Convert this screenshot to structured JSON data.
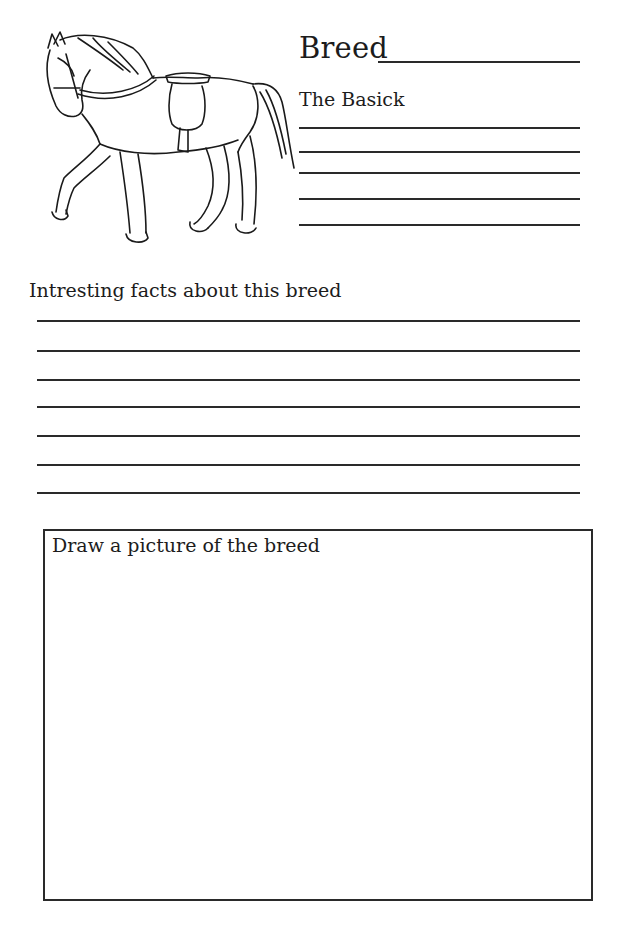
{
  "worksheet": {
    "illustration": "horse-with-saddle-line-drawing",
    "breed_label": "Breed",
    "basics_label": "The Basick",
    "basics_line_count": 5,
    "facts_label": "Intresting facts about this breed",
    "facts_line_count": 7,
    "drawing_box_label": "Draw a picture of the breed"
  }
}
